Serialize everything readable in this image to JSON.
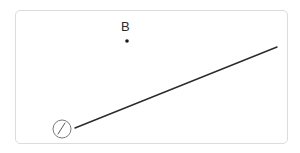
{
  "figure": {
    "title": "",
    "background_color": "#ffffff",
    "frame": {
      "name": "figure-border",
      "stroke_color": "#dcdcdc",
      "x": 15,
      "y": 10,
      "width": 273,
      "height": 134,
      "corner_radius": 5
    },
    "points": [
      {
        "id": "point-b",
        "label": "B",
        "label_x": 121,
        "label_y": 20,
        "dot_x": 127,
        "dot_y": 41,
        "dot_radius": 1.8,
        "color": "#1a1a1a"
      }
    ],
    "lines": [
      {
        "id": "ray-1",
        "x1": 75,
        "y1": 128,
        "x2": 277,
        "y2": 47,
        "stroke_color": "#2b2b2b",
        "stroke_width": 1.4
      }
    ],
    "badges": [
      {
        "id": "badge-one",
        "label": "1",
        "center_x": 62,
        "center_y": 129,
        "radius": 9,
        "stroke_color": "#6b6b6b",
        "text_color": "#4a4a4a"
      }
    ]
  }
}
